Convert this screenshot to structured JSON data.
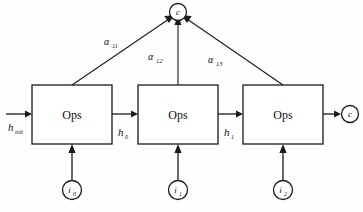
{
  "diagram": {
    "background_color": "#fefefe",
    "stroke_color": "#1a1a1a",
    "boxes": [
      {
        "id": "ops0",
        "label": "Ops"
      },
      {
        "id": "ops1",
        "label": "Ops"
      },
      {
        "id": "ops2",
        "label": "Ops"
      }
    ],
    "context_node": {
      "label": "c"
    },
    "output_node": {
      "label": "c"
    },
    "inputs": [
      {
        "id": "i0",
        "base": "i",
        "sub": "0"
      },
      {
        "id": "i1",
        "base": "i",
        "sub": "1"
      },
      {
        "id": "i2",
        "base": "i",
        "sub": "2"
      }
    ],
    "state_labels": [
      {
        "id": "h_init",
        "base": "h",
        "sub": "init"
      },
      {
        "id": "h0",
        "base": "h",
        "sub": "0"
      },
      {
        "id": "h1",
        "base": "h",
        "sub": "1"
      }
    ],
    "attention_labels": [
      {
        "id": "a11",
        "base": "α",
        "sub": "11"
      },
      {
        "id": "a12",
        "base": "α",
        "sub": "12"
      },
      {
        "id": "a13",
        "base": "α",
        "sub": "13"
      }
    ]
  }
}
